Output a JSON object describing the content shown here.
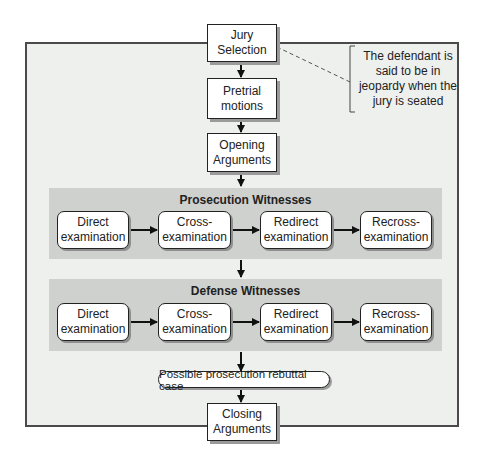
{
  "diagram": {
    "steps": {
      "jury_selection": "Jury\nSelection",
      "pretrial_motions": "Pretrial\nmotions",
      "opening_arguments": "Opening\nArguments",
      "rebuttal": "Possible prosecution rebuttal case",
      "closing_arguments": "Closing\nArguments"
    },
    "note": "The defendant is\nsaid to be in\njeopardy when the\njury is seated",
    "prosecution": {
      "title": "Prosecution Witnesses",
      "steps": [
        "Direct\nexamination",
        "Cross-\nexamination",
        "Redirect\nexamination",
        "Recross-\nexamination"
      ]
    },
    "defense": {
      "title": "Defense Witnesses",
      "steps": [
        "Direct\nexamination",
        "Cross-\nexamination",
        "Redirect\nexamination",
        "Recross-\nexamination"
      ]
    }
  }
}
